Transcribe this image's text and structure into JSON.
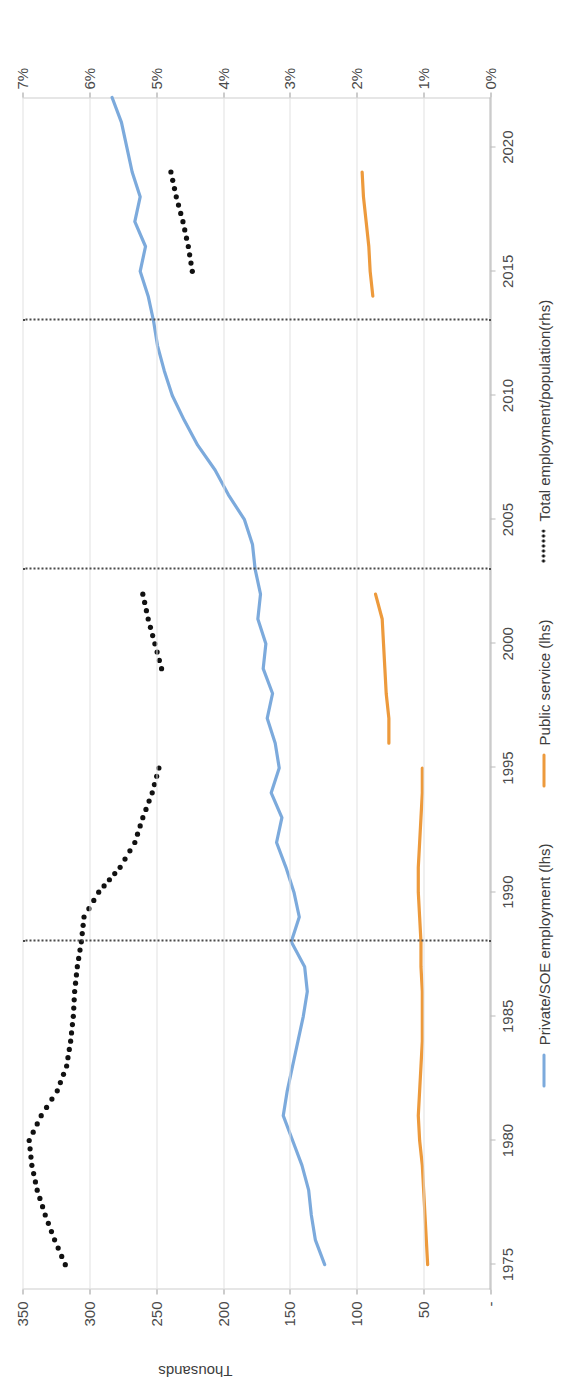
{
  "chart_data": {
    "type": "line",
    "title": "",
    "xlabel": "",
    "ylabel": "Thousands",
    "y2label": "",
    "xlim": [
      1974,
      2022
    ],
    "ylim": [
      0,
      350
    ],
    "y2lim": [
      0,
      7
    ],
    "grid": true,
    "legend_position": "bottom",
    "x_ticks": [
      1975,
      1980,
      1985,
      1990,
      1995,
      2000,
      2005,
      2010,
      2015,
      2020
    ],
    "y_ticks": [
      "-",
      "50",
      "100",
      "150",
      "200",
      "250",
      "300",
      "350"
    ],
    "y_tick_values": [
      0,
      50,
      100,
      150,
      200,
      250,
      300,
      350
    ],
    "y2_ticks": [
      "0%",
      "1%",
      "2%",
      "3%",
      "4%",
      "5%",
      "6%",
      "7%"
    ],
    "y2_tick_values": [
      0,
      1,
      2,
      3,
      4,
      5,
      6,
      7
    ],
    "annotations": [
      {
        "type": "vline",
        "x": 1988
      },
      {
        "type": "vline",
        "x": 2003
      },
      {
        "type": "vline",
        "x": 2013
      }
    ],
    "series": [
      {
        "name": "Private/SOE employment (lhs)",
        "axis": "lhs",
        "color": "#7CAADC",
        "style": "solid",
        "x": [
          1975,
          1976,
          1977,
          1978,
          1979,
          1980,
          1981,
          1982,
          1983,
          1984,
          1985,
          1986,
          1987,
          1988,
          1989,
          1990,
          1991,
          1992,
          1993,
          1994,
          1995,
          1996,
          1997,
          1998,
          1999,
          2000,
          2001,
          2002,
          2003,
          2004,
          2005,
          2006,
          2007,
          2008,
          2009,
          2010,
          2011,
          2012,
          2013,
          2014,
          2015,
          2016,
          2017,
          2018,
          2019,
          2020,
          2021,
          2022
        ],
        "y": [
          124,
          131,
          134,
          136,
          141,
          148,
          155,
          152,
          148,
          144,
          140,
          137,
          139,
          149,
          143,
          147,
          153,
          160,
          156,
          164,
          158,
          161,
          167,
          163,
          170,
          168,
          174,
          172,
          176,
          178,
          184,
          196,
          206,
          219,
          229,
          238,
          244,
          249,
          252,
          256,
          262,
          258,
          266,
          262,
          268,
          272,
          276,
          283
        ]
      },
      {
        "name": "Public service (lhs)",
        "axis": "lhs",
        "color": "#ED9A3C",
        "style": "solid",
        "segments": [
          {
            "x": [
              1975,
              1976,
              1977,
              1978,
              1979,
              1980,
              1981,
              1982,
              1983,
              1984,
              1985,
              1986,
              1987,
              1988,
              1989,
              1990,
              1991,
              1992,
              1993,
              1994,
              1995
            ],
            "y": [
              47,
              48,
              49,
              50,
              51,
              53,
              54,
              53,
              52,
              51,
              51,
              51,
              52,
              52,
              53,
              54,
              54,
              53,
              52,
              51,
              51
            ]
          },
          {
            "x": [
              1996,
              1997,
              1998,
              1999,
              2000,
              2001,
              2002
            ],
            "y": [
              76,
              76,
              78,
              79,
              80,
              81,
              86
            ]
          },
          {
            "x": [
              2014,
              2015,
              2016,
              2017,
              2018,
              2019
            ],
            "y": [
              88,
              90,
              91,
              93,
              95,
              96
            ]
          }
        ]
      },
      {
        "name": "Total employment/population(rhs)",
        "axis": "rhs",
        "color": "#111111",
        "style": "dotted",
        "segments": [
          {
            "x": [
              1975,
              1976,
              1977,
              1978,
              1979,
              1980,
              1981,
              1982,
              1983,
              1984,
              1985,
              1986,
              1987,
              1988,
              1989,
              1990,
              1991,
              1992,
              1993,
              1994,
              1995
            ],
            "y": [
              6.36,
              6.52,
              6.66,
              6.78,
              6.86,
              6.9,
              6.72,
              6.48,
              6.34,
              6.28,
              6.24,
              6.22,
              6.18,
              6.12,
              6.08,
              5.86,
              5.54,
              5.32,
              5.2,
              5.06,
              4.96
            ]
          },
          {
            "x": [
              1999,
              2000,
              2001,
              2002
            ],
            "y": [
              4.92,
              5.02,
              5.12,
              5.2
            ]
          },
          {
            "x": [
              2015,
              2016,
              2017,
              2018,
              2019
            ],
            "y": [
              4.46,
              4.52,
              4.6,
              4.7,
              4.78
            ]
          }
        ]
      }
    ]
  },
  "axis": {
    "left_title": "Thousands"
  }
}
